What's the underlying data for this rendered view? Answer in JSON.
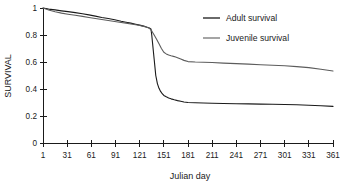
{
  "chart_data": {
    "type": "line",
    "title": "",
    "xlabel": "Julian day",
    "ylabel": "SURVIVAL",
    "xlim": [
      1,
      361
    ],
    "ylim": [
      0,
      1
    ],
    "grid": false,
    "legend_position": "top-right",
    "xticks": [
      1,
      31,
      61,
      91,
      121,
      151,
      181,
      211,
      241,
      271,
      301,
      331,
      361
    ],
    "xtick_labels": [
      "1",
      "31",
      "61",
      "91",
      "121",
      "151",
      "181",
      "211",
      "241",
      "271",
      "301",
      "331",
      "361"
    ],
    "yticks": [
      0,
      0.2,
      0.4,
      0.6,
      0.8,
      1
    ],
    "ytick_labels": [
      "0",
      "0.2",
      "0.4",
      "0.6",
      "0.8",
      "1"
    ],
    "series": [
      {
        "name": "Adult survival",
        "color": "#1a1a1a",
        "width": 1.1,
        "x": [
          1,
          8,
          16,
          24,
          32,
          41,
          50,
          58,
          66,
          74,
          82,
          90,
          98,
          104,
          110,
          116,
          121,
          126,
          130,
          133,
          135,
          136,
          137,
          138,
          139,
          140,
          141,
          143,
          145,
          147,
          149,
          151,
          154,
          157,
          160,
          164,
          168,
          172,
          176,
          181,
          190,
          200,
          211,
          225,
          241,
          256,
          271,
          286,
          301,
          316,
          331,
          346,
          361
        ],
        "y": [
          1.0,
          0.992,
          0.986,
          0.979,
          0.973,
          0.966,
          0.958,
          0.949,
          0.94,
          0.93,
          0.922,
          0.913,
          0.902,
          0.895,
          0.888,
          0.88,
          0.873,
          0.866,
          0.858,
          0.852,
          0.845,
          0.8,
          0.74,
          0.68,
          0.62,
          0.56,
          0.5,
          0.44,
          0.405,
          0.382,
          0.365,
          0.352,
          0.342,
          0.334,
          0.327,
          0.32,
          0.314,
          0.309,
          0.304,
          0.3,
          0.298,
          0.296,
          0.295,
          0.293,
          0.291,
          0.29,
          0.288,
          0.287,
          0.285,
          0.283,
          0.28,
          0.276,
          0.271
        ]
      },
      {
        "name": "Juvenile survival",
        "color": "#5c5c5c",
        "width": 1.1,
        "x": [
          1,
          8,
          16,
          24,
          32,
          41,
          50,
          58,
          66,
          74,
          82,
          90,
          98,
          104,
          110,
          116,
          121,
          126,
          130,
          133,
          136,
          139,
          142,
          145,
          148,
          151,
          154,
          157,
          160,
          164,
          168,
          172,
          176,
          181,
          190,
          200,
          211,
          225,
          241,
          256,
          271,
          286,
          301,
          316,
          331,
          346,
          361
        ],
        "y": [
          1.0,
          0.985,
          0.972,
          0.962,
          0.954,
          0.946,
          0.938,
          0.93,
          0.922,
          0.915,
          0.908,
          0.9,
          0.893,
          0.888,
          0.882,
          0.876,
          0.87,
          0.864,
          0.857,
          0.85,
          0.83,
          0.8,
          0.768,
          0.735,
          0.7,
          0.672,
          0.66,
          0.652,
          0.646,
          0.64,
          0.632,
          0.622,
          0.612,
          0.603,
          0.6,
          0.598,
          0.596,
          0.592,
          0.588,
          0.584,
          0.58,
          0.576,
          0.572,
          0.566,
          0.558,
          0.546,
          0.533
        ]
      }
    ]
  },
  "legend": {
    "items": [
      {
        "label": "Adult survival",
        "color": "#1a1a1a"
      },
      {
        "label": "Juvenile survival",
        "color": "#5c5c5c"
      }
    ]
  }
}
